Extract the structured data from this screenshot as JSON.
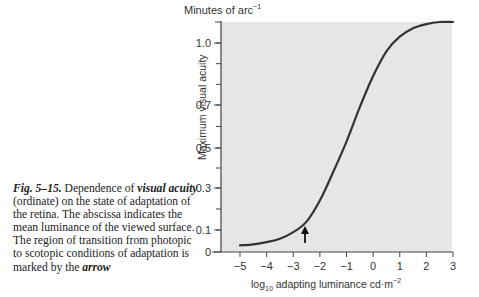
{
  "caption": {
    "fig_label": "Fig. 5–15.",
    "part1": " Dependence of ",
    "em1": "visual acuity",
    "part2": " (ordinate) on the state of adaptation of the retina. The abscissa indicates the mean luminance of the viewed surface. The region of transition from photopic to scotopic conditions of adaptation is marked by the ",
    "em2": "arrow"
  },
  "axes": {
    "unit_label": "Minutes of arc",
    "unit_exp": "−1",
    "ylabel": "Maximum visual acuity",
    "xlabel_pre": "log",
    "xlabel_sub": "10",
    "xlabel_main": " adapting luminance   cd·m",
    "xlabel_exp": "−2"
  },
  "chart_data": {
    "type": "line",
    "xlabel": "log10 adapting luminance cd·m−2",
    "ylabel": "Maximum visual acuity (Minutes of arc−1)",
    "xlim": [
      -5.3,
      3
    ],
    "ylim": [
      0,
      1.1
    ],
    "x_ticks": [
      -5,
      -4,
      -3,
      -2,
      -1,
      0,
      1,
      2,
      3
    ],
    "x_tick_labels": [
      "−5",
      "−4",
      "−3",
      "−2",
      "−1",
      "0",
      "1",
      "2",
      "3"
    ],
    "y_ticks": [
      0,
      0.1,
      0.3,
      0.5,
      0.7,
      1.0
    ],
    "y_tick_labels": [
      "0",
      "0.1",
      "0.3",
      "0.5",
      "0.7",
      "1.0"
    ],
    "grid": false,
    "legend": null,
    "series": [
      {
        "name": "Maximum visual acuity",
        "x": [
          -5,
          -4.5,
          -4,
          -3.5,
          -3,
          -2.5,
          -2,
          -1.5,
          -1,
          -0.5,
          0,
          0.5,
          1,
          1.5,
          2,
          2.5,
          3
        ],
        "y": [
          0.03,
          0.035,
          0.045,
          0.06,
          0.09,
          0.14,
          0.24,
          0.38,
          0.53,
          0.69,
          0.84,
          0.96,
          1.03,
          1.07,
          1.09,
          1.1,
          1.1
        ]
      }
    ],
    "annotations": [
      {
        "type": "arrow",
        "x": -2.5,
        "label": "transition photopic/scotopic"
      }
    ]
  }
}
